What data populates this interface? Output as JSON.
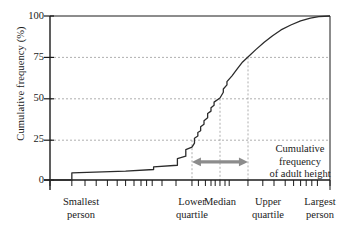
{
  "chart_data": {
    "type": "line",
    "title": "",
    "subtitle": "",
    "xlabel": "",
    "ylabel": "Cumulative frequency (%)",
    "ylim": [
      0,
      100
    ],
    "xlim": [
      0,
      100
    ],
    "grid": "horizontal dashed at 25, 50, 75; vertical dashed at quartiles",
    "legend": "none",
    "y_ticks": [
      "0",
      "25",
      "50",
      "75",
      "100"
    ],
    "y_tick_values": [
      0,
      25,
      50,
      75,
      100
    ],
    "x_tick_labels": [
      {
        "label_line1": "Smallest",
        "label_line2": "person",
        "x_pct": 8
      },
      {
        "label_line1": "Lower",
        "label_line2": "quartile",
        "x_pct": 50
      },
      {
        "label_line1": "Median",
        "label_line2": "",
        "x_pct": 60
      },
      {
        "label_line1": "Upper",
        "label_line2": "quartile",
        "x_pct": 70
      },
      {
        "label_line1": "Largest",
        "label_line2": "person",
        "x_pct": 95
      }
    ],
    "reference_lines": [
      {
        "name": "lower-quartile",
        "x_pct": 50.7,
        "y_pct": 25,
        "style": "dashed"
      },
      {
        "name": "median",
        "x_pct": 60.7,
        "y_pct": 50,
        "style": "dashed"
      },
      {
        "name": "upper-quartile",
        "x_pct": 70.7,
        "y_pct": 75,
        "style": "dashed"
      }
    ],
    "annotations": [
      {
        "name": "iqr-arrow",
        "type": "double-headed-arrow",
        "color": "#8c8c8c",
        "from_x_pct": 50.7,
        "to_x_pct": 70.7,
        "y_pct": 11
      },
      {
        "name": "iqr-caption",
        "lines": [
          "Cumulative",
          "frequency",
          "of adult height"
        ]
      }
    ],
    "series": [
      {
        "name": "Cumulative frequency of adult height",
        "color": "#2b2b2b",
        "points": [
          {
            "x": 0.0,
            "y": 0.0
          },
          {
            "x": 7.8,
            "y": 0.0
          },
          {
            "x": 7.8,
            "y": 4.3
          },
          {
            "x": 27.0,
            "y": 5.4
          },
          {
            "x": 37.0,
            "y": 6.4
          },
          {
            "x": 37.0,
            "y": 8.0
          },
          {
            "x": 45.5,
            "y": 9.0
          },
          {
            "x": 45.5,
            "y": 13.0
          },
          {
            "x": 48.5,
            "y": 14.5
          },
          {
            "x": 48.5,
            "y": 18.5
          },
          {
            "x": 50.7,
            "y": 20.0
          },
          {
            "x": 51.6,
            "y": 22.5
          },
          {
            "x": 51.6,
            "y": 25.5
          },
          {
            "x": 52.8,
            "y": 26.8
          },
          {
            "x": 52.8,
            "y": 29.0
          },
          {
            "x": 53.8,
            "y": 30.0
          },
          {
            "x": 53.8,
            "y": 32.5
          },
          {
            "x": 55.0,
            "y": 34.0
          },
          {
            "x": 55.0,
            "y": 36.2
          },
          {
            "x": 56.3,
            "y": 38.0
          },
          {
            "x": 56.3,
            "y": 40.5
          },
          {
            "x": 57.5,
            "y": 42.0
          },
          {
            "x": 57.5,
            "y": 44.0
          },
          {
            "x": 58.6,
            "y": 45.6
          },
          {
            "x": 58.6,
            "y": 47.5
          },
          {
            "x": 60.7,
            "y": 50.0
          },
          {
            "x": 61.9,
            "y": 53.5
          },
          {
            "x": 61.9,
            "y": 55.5
          },
          {
            "x": 63.2,
            "y": 58.0
          },
          {
            "x": 63.2,
            "y": 60.0
          },
          {
            "x": 65.0,
            "y": 63.5
          },
          {
            "x": 67.0,
            "y": 68.0
          },
          {
            "x": 68.8,
            "y": 72.0
          },
          {
            "x": 70.7,
            "y": 75.0
          },
          {
            "x": 73.5,
            "y": 79.5
          },
          {
            "x": 76.5,
            "y": 84.0
          },
          {
            "x": 79.5,
            "y": 88.0
          },
          {
            "x": 82.5,
            "y": 91.5
          },
          {
            "x": 86.0,
            "y": 94.5
          },
          {
            "x": 89.5,
            "y": 97.0
          },
          {
            "x": 93.0,
            "y": 98.7
          },
          {
            "x": 96.0,
            "y": 99.6
          },
          {
            "x": 100.0,
            "y": 100.0
          }
        ]
      }
    ],
    "x_axis_ticks_pct": [
      0.0,
      7.8,
      12.5,
      16.5,
      20.5,
      24.0,
      27.0,
      30.0,
      32.5,
      34.5,
      36.5,
      40.0,
      45.0,
      50.7,
      53.0,
      55.5,
      57.5,
      59.0,
      60.7,
      62.5,
      64.0,
      70.7,
      76.0,
      80.0,
      84.0,
      87.0,
      89.5,
      91.5,
      93.5,
      95.5,
      100.0
    ]
  },
  "colors": {
    "curve": "#2b2b2b",
    "axis": "#1a1a1a",
    "grid": "#9a9a9a",
    "arrow": "#8c8c8c",
    "background": "#ffffff"
  }
}
